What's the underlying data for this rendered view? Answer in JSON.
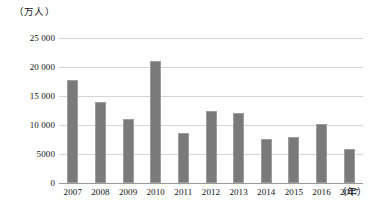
{
  "chart_data": {
    "type": "bar",
    "title": "",
    "subtitle": "",
    "xlabel": "（年）",
    "ylabel": "（万人）",
    "categories": [
      "2007",
      "2008",
      "2009",
      "2010",
      "2011",
      "2012",
      "2013",
      "2014",
      "2015",
      "2016",
      "2017"
    ],
    "values": [
      17700,
      14000,
      11000,
      21000,
      8600,
      12400,
      12100,
      7600,
      7900,
      10200,
      5900
    ],
    "ylim": [
      0,
      25000
    ],
    "ytick_values": [
      0,
      5000,
      10000,
      15000,
      20000,
      25000
    ],
    "ytick_labels": [
      "0",
      "5000",
      "10 000",
      "15 000",
      "20 000",
      "25 000"
    ],
    "grid": true,
    "legend": "none",
    "bar_color": "#7a7a7a",
    "grid_color": "#d4d4d4",
    "axis_color": "#9a9a9a"
  }
}
